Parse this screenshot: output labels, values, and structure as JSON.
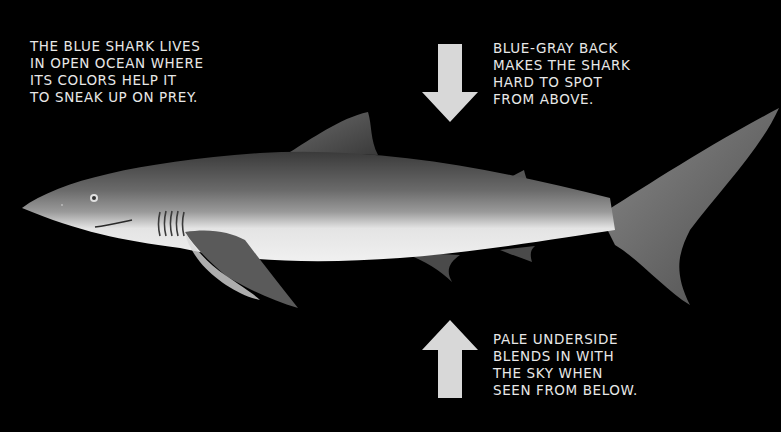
{
  "captions": {
    "intro": {
      "lines": [
        "The blue shark lives",
        "in open ocean where",
        "its colors help it",
        "to sneak up on prey."
      ]
    },
    "back": {
      "arrow": "down-arrow-icon",
      "lines": [
        "Blue-gray back",
        "makes the shark",
        "hard to spot",
        "from above."
      ]
    },
    "underside": {
      "arrow": "up-arrow-icon",
      "lines": [
        "Pale underside",
        "blends in with",
        "the sky when",
        "seen from below."
      ]
    }
  },
  "colors": {
    "background": "#000000",
    "text": "#e8e8e8",
    "arrow": "#d8d8d8",
    "shark_back": "#5a5a5a",
    "shark_belly": "#e6e6e6"
  },
  "illustration": {
    "subject": "blue shark (side view, facing left)"
  }
}
